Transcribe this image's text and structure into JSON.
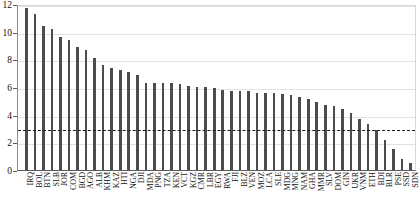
{
  "chart_data": {
    "type": "bar",
    "title": "",
    "subtitle": "",
    "xlabel": "",
    "ylabel": "",
    "ylim": [
      0,
      12
    ],
    "yticks": [
      0,
      2,
      4,
      6,
      8,
      10,
      12
    ],
    "grid": true,
    "legend": false,
    "legend_position": "none",
    "bar_color": "#4c4c4c",
    "gridline_color": "#e2e2e2",
    "reference_line": {
      "value": 3.05,
      "style": "dashed",
      "color": "#1a1a1a",
      "label": ""
    },
    "categories": [
      "IRQ",
      "BOL",
      "BTN",
      "SLB",
      "JOR",
      "COM",
      "BGD",
      "AGO",
      "ALB",
      "KHM",
      "KAZ",
      "HTI",
      "NGA",
      "DJI",
      "MDA",
      "PNG",
      "TZA",
      "KEN",
      "VCT",
      "KGZ",
      "CMR",
      "LBR",
      "EGY",
      "RWA",
      "FJI",
      "BLZ",
      "VEN",
      "MOZ",
      "LCA",
      "SLE",
      "MDG",
      "MNG",
      "NAM",
      "GHA",
      "MMR",
      "SLV",
      "DOM",
      "GIN",
      "UKR",
      "VNM",
      "ETH",
      "BDI",
      "BLR",
      "PSE",
      "SSD",
      "SDN"
    ],
    "values": [
      11.7,
      11.3,
      10.4,
      10.2,
      9.6,
      9.4,
      8.9,
      8.7,
      8.1,
      7.6,
      7.4,
      7.2,
      7.1,
      6.9,
      6.3,
      6.3,
      6.3,
      6.3,
      6.2,
      6.1,
      6.0,
      6.0,
      5.9,
      5.8,
      5.7,
      5.7,
      5.7,
      5.6,
      5.6,
      5.6,
      5.5,
      5.4,
      5.3,
      5.1,
      4.9,
      4.7,
      4.6,
      4.4,
      4.1,
      3.7,
      3.3,
      2.9,
      2.2,
      1.5,
      0.8,
      0.5
    ]
  }
}
